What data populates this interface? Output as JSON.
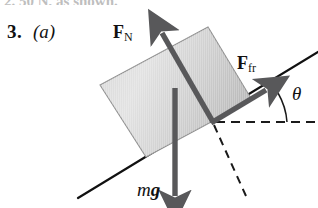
{
  "figure": {
    "problem_number": "3.",
    "part_label": "(a)",
    "cutoff_text_above": "2. 50 N, as shown.",
    "labels": {
      "normal_force": {
        "symbol": "F",
        "subscript": "N",
        "name": "normal-force"
      },
      "friction_force": {
        "symbol": "F",
        "subscript": "fr",
        "name": "friction-force"
      },
      "weight": {
        "mass_symbol": "m",
        "gravity_symbol": "g",
        "name": "weight"
      },
      "angle": {
        "symbol": "θ",
        "name": "incline-angle"
      }
    },
    "colors": {
      "background": "#ffffff",
      "ink": "#111111",
      "arrow_gray": "#58585a",
      "block_fill_light": "#dedede",
      "block_fill_dark": "#b9b9b9",
      "block_edge": "#8f8f8f",
      "dashed_line": "#1a1a1a",
      "incline_line": "#111111"
    },
    "geometry": {
      "contact_point": [
        213,
        122
      ],
      "incline_start": [
        78,
        198
      ],
      "incline_end": [
        318,
        52
      ],
      "incline_angle_degrees": 31,
      "normal_force_arrow": {
        "from": [
          213,
          122
        ],
        "to": [
          159,
          27
        ]
      },
      "friction_force_arrow": {
        "from": [
          213,
          122
        ],
        "to": [
          271,
          87
        ]
      },
      "weight_arrow": {
        "from": [
          175,
          88
        ],
        "to": [
          175,
          204
        ]
      },
      "horizontal_dashed": {
        "from": [
          216,
          122
        ],
        "to": [
          318,
          122
        ]
      },
      "perpendicular_dashed": {
        "from": [
          213,
          124
        ],
        "to": [
          246,
          196
        ]
      },
      "angle_arc_radius": 62,
      "block_corners": [
        [
          100,
          85
        ],
        [
          208,
          27
        ],
        [
          252,
          100
        ],
        [
          146,
          157
        ]
      ]
    }
  }
}
